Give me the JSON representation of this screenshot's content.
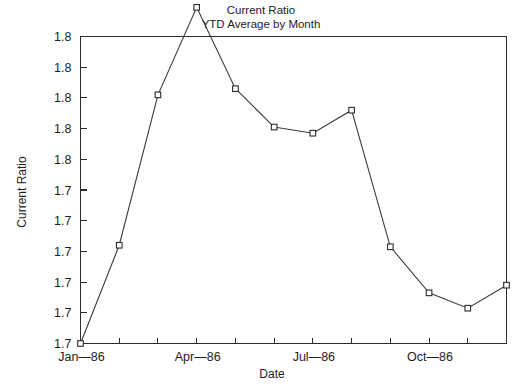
{
  "chart_data": {
    "type": "line",
    "title": "Current Ratio",
    "subtitle": "YTD Average by Month",
    "xlabel": "Date",
    "ylabel": "Current Ratio",
    "grid": false,
    "legend": false,
    "marker": "open-square",
    "categories": [
      "Jan-86",
      "Feb-86",
      "Mar-86",
      "Apr-86",
      "May-86",
      "Jun-86",
      "Jul-86",
      "Aug-86",
      "Sep-86",
      "Oct-86",
      "Nov-86",
      "Dec-86"
    ],
    "x_tick_labels": [
      "Jan—86",
      "Apr—86",
      "Jul—86",
      "Oct—86"
    ],
    "x_tick_label_indices": [
      0,
      3,
      6,
      9
    ],
    "x_tick_count": 12,
    "y_tick_labels": [
      "1.8",
      "1.8",
      "1.8",
      "1.8",
      "1.8",
      "1.7",
      "1.7",
      "1.7",
      "1.7",
      "1.7",
      "1.7"
    ],
    "y_tick_count": 11,
    "ylim": [
      0,
      10
    ],
    "values": [
      0.0,
      3.2,
      8.1,
      10.95,
      8.3,
      7.05,
      6.85,
      7.6,
      3.15,
      1.65,
      1.15,
      1.9
    ],
    "series": [
      {
        "name": "Current Ratio YTD Average",
        "values": [
          0.0,
          3.2,
          8.1,
          10.95,
          8.3,
          7.05,
          6.85,
          7.6,
          3.15,
          1.65,
          1.15,
          1.9
        ]
      }
    ],
    "colors": {
      "line": "#3a3a3a",
      "marker_fill": "#ffffff",
      "marker_stroke": "#2b2b2b",
      "axis": "#2b2b2b",
      "background": "#ffffff"
    }
  }
}
